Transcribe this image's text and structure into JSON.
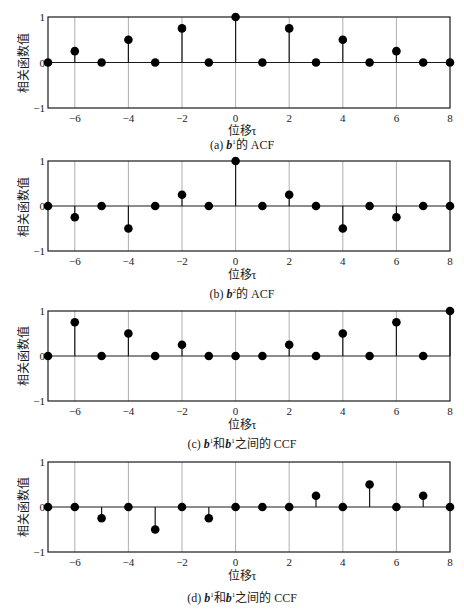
{
  "chart_data": [
    {
      "type": "stem",
      "id": "a",
      "caption_prefix": "(a)",
      "caption_symbol": "b",
      "caption_sup": "1",
      "caption_sub": "1",
      "caption_suffix": "的 ACF",
      "xlabel": "位移τ",
      "ylabel": "相关函数值",
      "xlim": [
        -7,
        8
      ],
      "ylim": [
        -1,
        1
      ],
      "xticks": [
        -6,
        -4,
        -2,
        0,
        2,
        4,
        6,
        8
      ],
      "xtick_labels": [
        "−6",
        "−4",
        "−2",
        "0",
        "2",
        "4",
        "6",
        "8"
      ],
      "yticks": [
        -1,
        0,
        1
      ],
      "ytick_labels": [
        "−1",
        "0",
        "1"
      ],
      "grid": "x",
      "x": [
        -7,
        -6,
        -5,
        -4,
        -3,
        -2,
        -1,
        0,
        1,
        2,
        3,
        4,
        5,
        6,
        7,
        8
      ],
      "values": [
        0,
        0.25,
        0,
        0.5,
        0,
        0.75,
        0,
        1,
        0,
        0.75,
        0,
        0.5,
        0,
        0.25,
        0,
        0
      ]
    },
    {
      "type": "stem",
      "id": "b",
      "caption_prefix": "(b)",
      "caption_symbol": "b",
      "caption_sup": "2",
      "caption_sub": "2",
      "caption_suffix": "的 ACF",
      "xlabel": "位移τ",
      "ylabel": "相关函数值",
      "xlim": [
        -7,
        8
      ],
      "ylim": [
        -1,
        1
      ],
      "xticks": [
        -6,
        -4,
        -2,
        0,
        2,
        4,
        6,
        8
      ],
      "xtick_labels": [
        "−6",
        "−4",
        "−2",
        "0",
        "2",
        "4",
        "6",
        "8"
      ],
      "yticks": [
        -1,
        0,
        1
      ],
      "ytick_labels": [
        "−1",
        "0",
        "1"
      ],
      "grid": "x",
      "x": [
        -7,
        -6,
        -5,
        -4,
        -3,
        -2,
        -1,
        0,
        1,
        2,
        3,
        4,
        5,
        6,
        7,
        8
      ],
      "values": [
        0,
        -0.25,
        0,
        -0.5,
        0,
        0.25,
        0,
        1,
        0,
        0.25,
        0,
        -0.5,
        0,
        -0.25,
        0,
        0
      ]
    },
    {
      "type": "stem",
      "id": "c",
      "caption_prefix": "(c)",
      "caption_symbol": "b",
      "caption_sup": "1",
      "caption_sub": "1",
      "caption_mid": "和",
      "caption_symbol2": "b",
      "caption_sup2": "1",
      "caption_sub2": "2",
      "caption_suffix": "之间的 CCF",
      "xlabel": "位移τ",
      "ylabel": "相关函数值",
      "xlim": [
        -7,
        8
      ],
      "ylim": [
        -1,
        1
      ],
      "xticks": [
        -6,
        -4,
        -2,
        0,
        2,
        4,
        6,
        8
      ],
      "xtick_labels": [
        "−6",
        "−4",
        "−2",
        "0",
        "2",
        "4",
        "6",
        "8"
      ],
      "yticks": [
        -1,
        0,
        1
      ],
      "ytick_labels": [
        "−1",
        "0",
        "1"
      ],
      "grid": "x",
      "x": [
        -7,
        -6,
        -5,
        -4,
        -3,
        -2,
        -1,
        0,
        1,
        2,
        3,
        4,
        5,
        6,
        7,
        8
      ],
      "values": [
        0,
        0.75,
        0,
        0.5,
        0,
        0.25,
        0,
        0,
        0,
        0.25,
        0,
        0.5,
        0,
        0.75,
        0,
        1
      ]
    },
    {
      "type": "stem",
      "id": "d",
      "caption_prefix": "(d)",
      "caption_symbol": "b",
      "caption_sup": "1",
      "caption_sub": "1",
      "caption_mid": "和",
      "caption_symbol2": "b",
      "caption_sup2": "1",
      "caption_sub2": "2",
      "caption_suffix": "之间的 CCF",
      "xlabel": "位移τ",
      "ylabel": "相关函数值",
      "xlim": [
        -7,
        8
      ],
      "ylim": [
        -1,
        1
      ],
      "xticks": [
        -6,
        -4,
        -2,
        0,
        2,
        4,
        6,
        8
      ],
      "xtick_labels": [
        "−6",
        "−4",
        "−2",
        "0",
        "2",
        "4",
        "6",
        "8"
      ],
      "yticks": [
        -1,
        0,
        1
      ],
      "ytick_labels": [
        "−1",
        "0",
        "1"
      ],
      "grid": "x",
      "x": [
        -7,
        -6,
        -5,
        -4,
        -3,
        -2,
        -1,
        0,
        1,
        2,
        3,
        4,
        5,
        6,
        7,
        8
      ],
      "values": [
        0,
        0,
        -0.25,
        0,
        -0.5,
        0,
        -0.25,
        0,
        0,
        0,
        0.25,
        0,
        0.5,
        0,
        0.25,
        0
      ]
    }
  ]
}
